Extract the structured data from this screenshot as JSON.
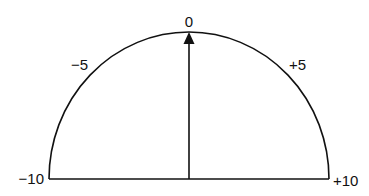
{
  "diagram": {
    "type": "semicircular-scale-gauge",
    "colors": {
      "stroke": "#111111",
      "background": "#ffffff"
    },
    "scale": {
      "min": -10,
      "max": 10,
      "labels": [
        {
          "id": "minus10",
          "text": "−10",
          "value": -10
        },
        {
          "id": "minus5",
          "text": "−5",
          "value": -5
        },
        {
          "id": "zero",
          "text": "0",
          "value": 0
        },
        {
          "id": "plus5",
          "text": "+5",
          "value": 5
        },
        {
          "id": "plus10",
          "text": "+10",
          "value": 10
        }
      ]
    },
    "pointer": {
      "value": 0,
      "direction": "up",
      "icon": "arrow-up-icon"
    }
  }
}
